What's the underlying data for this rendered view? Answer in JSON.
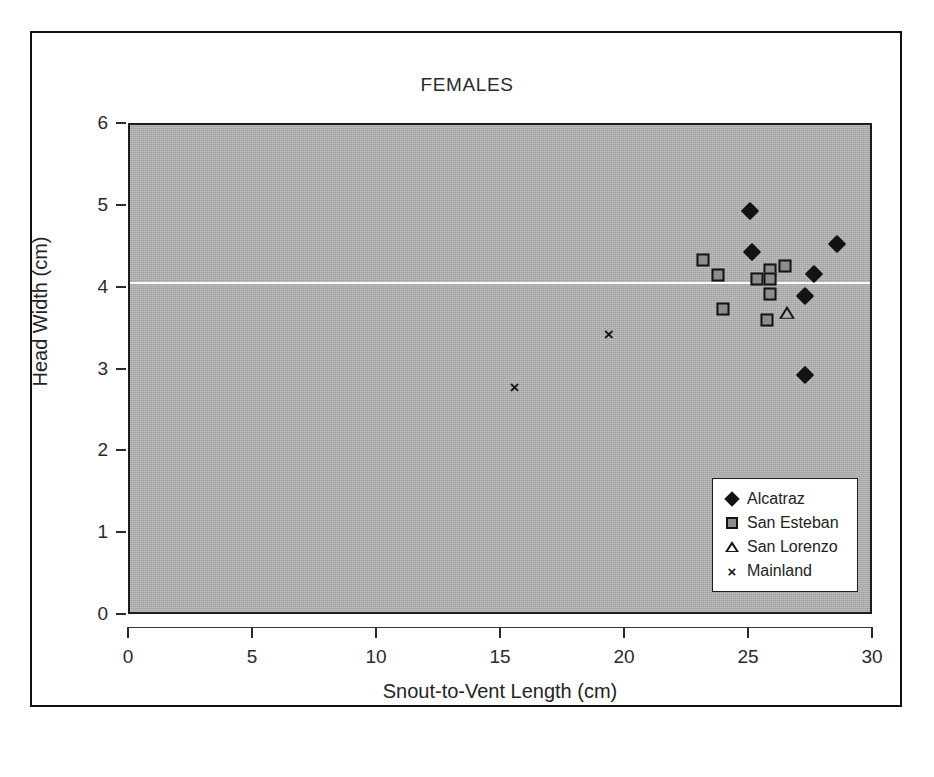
{
  "figure": {
    "title": "FEMALES",
    "background_color": "#ffffff",
    "plot_fill_color": "#b3b3b3",
    "frame_color": "#111111"
  },
  "axes": {
    "x": {
      "label": "Snout-to-Vent Length (cm)",
      "ticks": [
        "0",
        "5",
        "10",
        "15",
        "20",
        "25",
        "30"
      ],
      "min": 0,
      "max": 30
    },
    "y": {
      "label": "Head Width (cm)",
      "ticks": [
        "0",
        "1",
        "2",
        "3",
        "4",
        "5",
        "6"
      ],
      "min": 0,
      "max": 6
    }
  },
  "legend": {
    "position": "bottom-right",
    "entries": [
      {
        "label": "Alcatraz",
        "marker": "filled-diamond-icon",
        "color": "#131313"
      },
      {
        "label": "San Esteban",
        "marker": "gray-square-icon",
        "color": "#8d8d8d"
      },
      {
        "label": "San Lorenzo",
        "marker": "open-triangle-icon",
        "color": "#1a1a1a"
      },
      {
        "label": "Mainland",
        "marker": "cross-x-icon",
        "color": "#131313"
      }
    ]
  },
  "chart_data": {
    "type": "scatter",
    "title": "FEMALES",
    "xlabel": "Snout-to-Vent Length (cm)",
    "ylabel": "Head Width (cm)",
    "xlim": [
      0,
      30
    ],
    "ylim": [
      0,
      6
    ],
    "xticks": [
      0,
      5,
      10,
      15,
      20,
      25,
      30
    ],
    "yticks": [
      0,
      1,
      2,
      3,
      4,
      5,
      6
    ],
    "grid": false,
    "legend_position": "lower right",
    "reference_lines": [
      {
        "orientation": "horizontal",
        "y": 4.07,
        "color": "#ffffff"
      }
    ],
    "series": [
      {
        "name": "Alcatraz",
        "marker": "filled-diamond",
        "color": "#131313",
        "points": [
          [
            25.0,
            4.95
          ],
          [
            25.1,
            4.45
          ],
          [
            28.5,
            4.54
          ],
          [
            27.6,
            4.18
          ],
          [
            27.2,
            3.91
          ],
          [
            27.2,
            2.94
          ]
        ]
      },
      {
        "name": "San Esteban",
        "marker": "gray-square",
        "color": "#8d8d8d",
        "points": [
          [
            23.1,
            4.35
          ],
          [
            23.7,
            4.17
          ],
          [
            25.8,
            4.23
          ],
          [
            26.4,
            4.28
          ],
          [
            25.3,
            4.12
          ],
          [
            25.8,
            4.12
          ],
          [
            25.8,
            3.94
          ],
          [
            23.9,
            3.75
          ],
          [
            25.7,
            3.62
          ]
        ]
      },
      {
        "name": "San Lorenzo",
        "marker": "open-triangle",
        "color": "#1a1a1a",
        "points": [
          [
            26.5,
            3.7
          ]
        ]
      },
      {
        "name": "Mainland",
        "marker": "cross-x",
        "color": "#131313",
        "points": [
          [
            15.5,
            2.8
          ],
          [
            19.3,
            3.44
          ]
        ]
      }
    ]
  }
}
